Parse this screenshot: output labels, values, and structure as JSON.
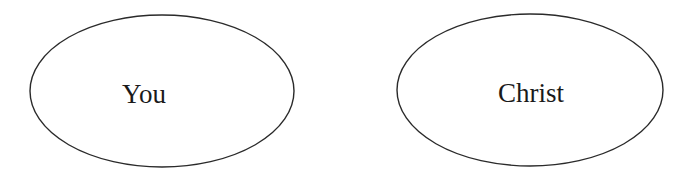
{
  "diagram": {
    "stroke_color": "#2a2a2a",
    "text_color": "#1a1a1a",
    "background": "#ffffff",
    "nodes": [
      {
        "id": "you",
        "label": "You",
        "shape": "ellipse",
        "cx": 162,
        "cy": 91,
        "rx": 132,
        "ry": 76
      },
      {
        "id": "christ",
        "label": "Christ",
        "shape": "ellipse",
        "cx": 530,
        "cy": 90,
        "rx": 133,
        "ry": 76
      }
    ]
  }
}
